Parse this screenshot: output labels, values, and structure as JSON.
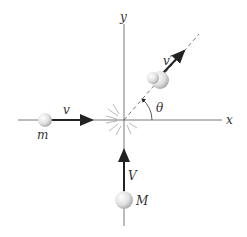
{
  "diagram": {
    "type": "collision-diagram",
    "axes": {
      "x_label": "x",
      "y_label": "y"
    },
    "bodies": [
      {
        "id": "m",
        "mass_label": "m",
        "velocity_label": "v",
        "direction": "+x"
      },
      {
        "id": "M",
        "mass_label": "M",
        "velocity_label": "V",
        "direction": "+y"
      },
      {
        "id": "combined",
        "velocity_label": "v′",
        "direction": "at angle θ above +x"
      }
    ],
    "angle_label": "θ",
    "colors": {
      "axis": "#555555",
      "arrow": "#222222",
      "ball_fill": "#e8e8e8",
      "ball_shade": "#b0b0b0",
      "text": "#333333"
    }
  }
}
